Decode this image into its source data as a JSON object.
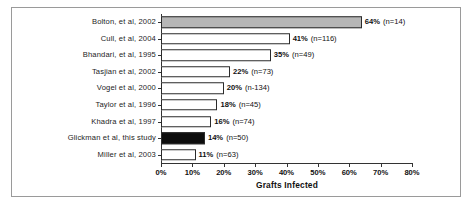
{
  "chart_data": {
    "type": "bar",
    "orientation": "horizontal",
    "title": "",
    "xlabel": "Grafts Infected",
    "ylabel": "",
    "xlim": [
      0,
      80
    ],
    "xticks": [
      "0%",
      "10%",
      "20%",
      "30%",
      "40%",
      "50%",
      "60%",
      "70%",
      "80%"
    ],
    "xtick_values": [
      0,
      10,
      20,
      30,
      40,
      50,
      60,
      70,
      80
    ],
    "grid": false,
    "legend": "none",
    "categories": [
      "Bolton, et al, 2002",
      "Cull, et al, 2004",
      "Bhandari, et al, 1995",
      "Tasjian et al, 2002",
      "Vogel et al, 2000",
      "Taylor et al, 1996",
      "Khadra et al, 1997",
      "Glickman et al, this study",
      "Miller et al, 2003"
    ],
    "values": [
      64,
      41,
      35,
      22,
      20,
      18,
      16,
      14,
      11
    ],
    "value_labels": [
      "64%",
      "41%",
      "35%",
      "22%",
      "20%",
      "18%",
      "16%",
      "14%",
      "11%"
    ],
    "n_labels": [
      "(n=14)",
      "(n=116)",
      "(n=49)",
      "(n=73)",
      "(n-134)",
      "(n=45)",
      "(n=74)",
      "(n=50)",
      "(n=63)"
    ],
    "n_values": [
      14,
      116,
      49,
      73,
      134,
      45,
      74,
      50,
      63
    ],
    "bar_fills": [
      "gray",
      "white",
      "white",
      "white",
      "white",
      "white",
      "white",
      "black",
      "white"
    ],
    "colors": {
      "gray_bar": "#b6b6b6",
      "black_bar": "#0d0d0d",
      "white_bar": "#ffffff",
      "bar_outline": "#2b2b2b",
      "axis": "#333333",
      "frame": "#9a9a9a",
      "text": "#111111",
      "background": "#ffffff"
    }
  }
}
